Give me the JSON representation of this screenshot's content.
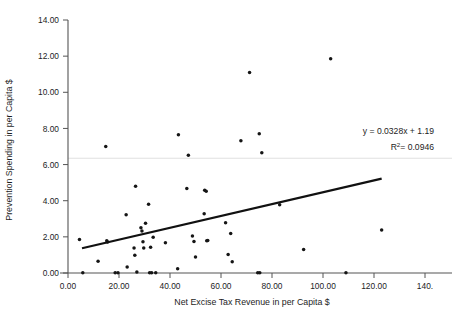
{
  "chart_data": {
    "type": "scatter",
    "title": "",
    "xlabel": "Net Excise Tax Revenue in per Capita $",
    "ylabel": "Prevention Spending in per Capita $",
    "xlim": [
      0,
      140
    ],
    "ylim": [
      0,
      14
    ],
    "xticks": [
      0,
      20,
      40,
      60,
      80,
      100,
      120,
      140
    ],
    "yticks": [
      0,
      2,
      4,
      6,
      8,
      10,
      12,
      14
    ],
    "xtick_labels": [
      "0.00",
      "20.00",
      "40.00",
      "60.00",
      "80.00",
      "100.00",
      "120.00",
      "140."
    ],
    "ytick_labels": [
      "0.00",
      "2.00",
      "4.00",
      "6.00",
      "8.00",
      "10.00",
      "12.00",
      "14.00"
    ],
    "grid": "single faint horizontal gridline near y=6.35",
    "gridline_y": 6.35,
    "legend": "none",
    "annotations": [
      {
        "name": "regression-equation",
        "text": "y = 0.0328x + 1.19",
        "x": 118,
        "y": 7.3
      },
      {
        "name": "r-squared",
        "text_prefix": "R",
        "text_sup": "2",
        "text_suffix": "= 0.0946",
        "x": 120,
        "y": 6.5
      }
    ],
    "trendline": {
      "type": "linear",
      "slope": 0.0328,
      "intercept": 1.19,
      "equation": "y = 0.0328x + 1.19",
      "r_squared": 0.0946,
      "x_start": 5.5,
      "x_end": 123.0,
      "y_start": 1.37,
      "y_end": 5.22
    },
    "points": [
      {
        "x": 4.5,
        "y": 1.85
      },
      {
        "x": 5.8,
        "y": 0.02
      },
      {
        "x": 11.8,
        "y": 0.65
      },
      {
        "x": 14.8,
        "y": 7.0
      },
      {
        "x": 15.2,
        "y": 1.78
      },
      {
        "x": 15.5,
        "y": 1.72
      },
      {
        "x": 18.5,
        "y": 0.02
      },
      {
        "x": 19.6,
        "y": 0.02
      },
      {
        "x": 22.8,
        "y": 3.22
      },
      {
        "x": 23.2,
        "y": 0.33
      },
      {
        "x": 25.9,
        "y": 1.38
      },
      {
        "x": 26.2,
        "y": 0.98
      },
      {
        "x": 26.5,
        "y": 4.8
      },
      {
        "x": 27.0,
        "y": 0.06
      },
      {
        "x": 28.6,
        "y": 2.5
      },
      {
        "x": 29.0,
        "y": 2.32
      },
      {
        "x": 29.4,
        "y": 1.73
      },
      {
        "x": 29.7,
        "y": 1.38
      },
      {
        "x": 30.4,
        "y": 2.75
      },
      {
        "x": 31.6,
        "y": 3.8
      },
      {
        "x": 32.0,
        "y": 0.02
      },
      {
        "x": 32.4,
        "y": 1.42
      },
      {
        "x": 32.8,
        "y": 0.02
      },
      {
        "x": 33.4,
        "y": 1.98
      },
      {
        "x": 34.4,
        "y": 0.02
      },
      {
        "x": 38.2,
        "y": 1.68
      },
      {
        "x": 43.0,
        "y": 0.24
      },
      {
        "x": 43.3,
        "y": 7.65
      },
      {
        "x": 46.6,
        "y": 4.68
      },
      {
        "x": 47.2,
        "y": 6.52
      },
      {
        "x": 48.8,
        "y": 2.05
      },
      {
        "x": 49.4,
        "y": 1.75
      },
      {
        "x": 50.0,
        "y": 0.88
      },
      {
        "x": 53.4,
        "y": 3.28
      },
      {
        "x": 53.6,
        "y": 4.58
      },
      {
        "x": 54.2,
        "y": 4.52
      },
      {
        "x": 54.4,
        "y": 1.78
      },
      {
        "x": 54.8,
        "y": 1.8
      },
      {
        "x": 61.8,
        "y": 2.78
      },
      {
        "x": 62.8,
        "y": 1.02
      },
      {
        "x": 63.8,
        "y": 2.18
      },
      {
        "x": 64.4,
        "y": 0.62
      },
      {
        "x": 67.8,
        "y": 7.32
      },
      {
        "x": 71.2,
        "y": 11.1
      },
      {
        "x": 74.4,
        "y": 0.02
      },
      {
        "x": 75.2,
        "y": 0.02
      },
      {
        "x": 75.0,
        "y": 7.7
      },
      {
        "x": 76.0,
        "y": 6.65
      },
      {
        "x": 83.0,
        "y": 3.78
      },
      {
        "x": 92.4,
        "y": 1.3
      },
      {
        "x": 103.0,
        "y": 11.85
      },
      {
        "x": 109.0,
        "y": 0.02
      },
      {
        "x": 123.0,
        "y": 2.38
      }
    ]
  },
  "colors": {
    "marker": "#151515",
    "trendline": "#111111",
    "axis": "#555555",
    "gridline": "#d7d7d7",
    "background": "#ffffff",
    "text": "#1d1d1d"
  }
}
